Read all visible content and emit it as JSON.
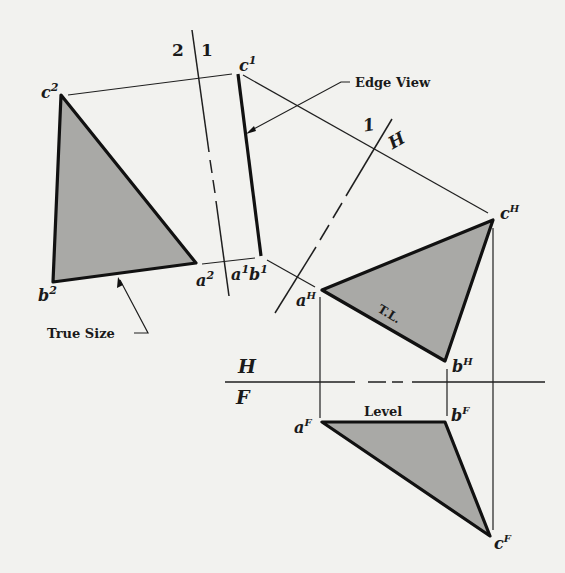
{
  "diagram": {
    "fold_lines": [
      {
        "id": "2-1",
        "left_label": "2",
        "right_label": "1"
      },
      {
        "id": "1-H",
        "left_label": "1",
        "right_label": "H"
      },
      {
        "id": "H-F",
        "top_label": "H",
        "bottom_label": "F"
      }
    ],
    "views": {
      "view2": {
        "name": "True Size view",
        "vertices": {
          "c": "c",
          "b": "b",
          "a": "a"
        },
        "superscript": "2"
      },
      "view1": {
        "name": "Edge View",
        "top": "c",
        "bottom": "a",
        "bottom2": "b",
        "superscript": "1"
      },
      "viewH": {
        "name": "Top view",
        "vertices": {
          "a": "a",
          "b": "b",
          "c": "c"
        },
        "superscript": "H"
      },
      "viewF": {
        "name": "Front view",
        "vertices": {
          "a": "a",
          "b": "b",
          "c": "c"
        },
        "superscript": "F"
      }
    },
    "callouts": {
      "edge_view": "Edge View",
      "true_size": "True Size",
      "true_length": "T.L.",
      "level": "Level"
    },
    "colors": {
      "face_fill": "#a9a9a6",
      "line": "#111111",
      "background": "#f2f2ef"
    }
  }
}
